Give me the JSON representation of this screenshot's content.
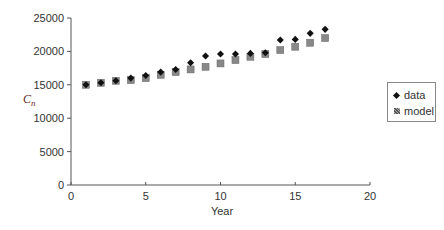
{
  "chart_data": {
    "type": "scatter",
    "title": "",
    "xlabel": "Year",
    "ylabel": "C_n",
    "ylabel_display": {
      "main": "C",
      "sub": "n"
    },
    "xlim": [
      0,
      20
    ],
    "ylim": [
      0,
      25000
    ],
    "xticks": [
      0,
      5,
      10,
      15,
      20
    ],
    "yticks": [
      0,
      5000,
      10000,
      15000,
      20000,
      25000
    ],
    "grid": false,
    "legend_position": "right",
    "x": [
      1,
      2,
      3,
      4,
      5,
      6,
      7,
      8,
      9,
      10,
      11,
      12,
      13,
      14,
      15,
      16,
      17
    ],
    "series": [
      {
        "name": "data",
        "marker": "diamond",
        "color": "#111111",
        "values": [
          15000,
          15300,
          15600,
          16000,
          16400,
          16900,
          17300,
          18300,
          19300,
          19600,
          19600,
          19700,
          19800,
          21700,
          21800,
          22700,
          23300
        ]
      },
      {
        "name": "model",
        "marker": "hatched-square",
        "color": "#888888",
        "values": [
          15000,
          15300,
          15600,
          15700,
          16000,
          16500,
          16900,
          17300,
          17700,
          18200,
          18700,
          19200,
          19600,
          20200,
          20700,
          21300,
          22000
        ]
      }
    ]
  },
  "legend": {
    "items": [
      {
        "label": "data"
      },
      {
        "label": "model"
      }
    ]
  },
  "axes": {
    "x_tick_labels": [
      "0",
      "5",
      "10",
      "15",
      "20"
    ],
    "y_tick_labels": [
      "0",
      "5000",
      "10000",
      "15000",
      "20000",
      "25000"
    ],
    "x_title": "Year",
    "y_title_main": "C",
    "y_title_sub": "n"
  }
}
